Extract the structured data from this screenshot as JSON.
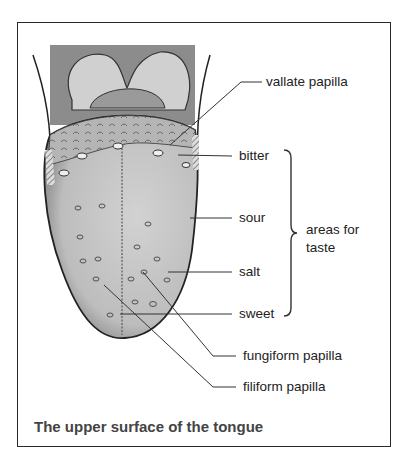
{
  "figure": {
    "caption": "The upper surface of the tongue",
    "labels": {
      "vallate_papilla": "vallate papilla",
      "bitter": "bitter",
      "sour": "sour",
      "salt": "salt",
      "sweet": "sweet",
      "areas_for_taste_line1": "areas for",
      "areas_for_taste_line2": "taste",
      "fungiform_papilla": "fungiform papilla",
      "filiform_papilla": "filiform papilla"
    },
    "colors": {
      "background": "#ffffff",
      "frame": "#2a2a2a",
      "tongue_fill": "#c4c4c4",
      "throat_fill": "#8c8c8c",
      "tonsil_fill": "#d0d0d0",
      "caption_text": "#444444"
    }
  }
}
